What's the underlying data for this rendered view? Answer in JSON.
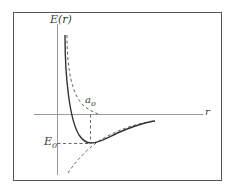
{
  "diagram": {
    "y_axis_label": "E(r)",
    "x_axis_label": "r",
    "equilibrium_distance_label": {
      "base": "a",
      "sub": "o"
    },
    "minimum_energy_label": {
      "base": "E",
      "sub": "0"
    },
    "curves": [
      {
        "name": "total-potential",
        "style": "solid"
      },
      {
        "name": "repulsive-term",
        "style": "dashed"
      },
      {
        "name": "attractive-term",
        "style": "dashed"
      }
    ],
    "colors": {
      "frame": "#555555",
      "axes": "#9a9a9a",
      "curve": "#333333",
      "dashed": "#555555",
      "background": "#ffffff"
    }
  }
}
